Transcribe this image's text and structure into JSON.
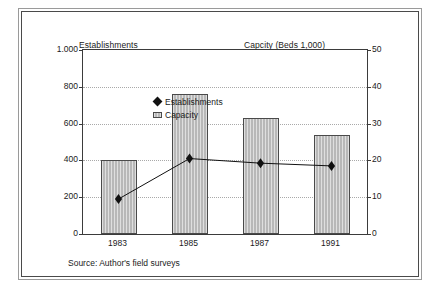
{
  "figure": {
    "source_note": "Source: Author's field surveys",
    "left_axis_title": "Establishments",
    "right_axis_title": "Capcity (Beds 1,000)"
  },
  "legend": {
    "items": [
      {
        "label": "Establishments",
        "marker": "diamond-marker",
        "color": "#111111"
      },
      {
        "label": "Capacity",
        "marker": "bar-swatch",
        "color": "#b8b8b8"
      }
    ]
  },
  "chart_data": {
    "type": "bar",
    "title": "",
    "subtitle": "",
    "categories": [
      "1983",
      "1985",
      "1987",
      "1991"
    ],
    "xlabel": "",
    "grid": true,
    "legend_position": "top-left-inside",
    "series": [
      {
        "name": "Capacity",
        "type": "bar",
        "axis": "right",
        "values": [
          20,
          38,
          31.5,
          27
        ],
        "color": "#b8b8b8"
      },
      {
        "name": "Establishments",
        "type": "line",
        "axis": "left",
        "values": [
          190,
          410,
          385,
          370
        ],
        "color": "#111111",
        "marker": "diamond"
      }
    ],
    "axes": {
      "left": {
        "label": "Establishments",
        "min": 0,
        "max": 1000,
        "ticks": [
          0,
          200,
          400,
          600,
          800,
          1000
        ],
        "tick_labels": [
          "0",
          "200",
          "400",
          "600",
          "800",
          "1.000"
        ]
      },
      "right": {
        "label": "Capcity (Beds 1,000)",
        "min": 0,
        "max": 50,
        "ticks": [
          0,
          10,
          20,
          30,
          40,
          50
        ],
        "tick_labels": [
          "0",
          "10",
          "20",
          "30",
          "40",
          "50"
        ]
      }
    }
  }
}
